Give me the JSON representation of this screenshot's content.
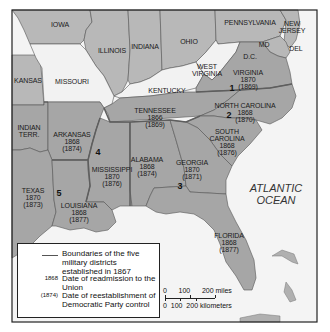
{
  "map": {
    "subject": "Reconstruction in the South — military districts and readmission dates",
    "colors": {
      "confederate_states": "#a6a6a6",
      "union_states": "#b8b8b8",
      "border_states": "#f2f2f2",
      "ocean": "#f4f4f4",
      "district_boundary": "#6e6e6e",
      "frame": "#222222"
    },
    "states": [
      {
        "name": "IOWA"
      },
      {
        "name": "ILLINOIS"
      },
      {
        "name": "INDIANA"
      },
      {
        "name": "OHIO"
      },
      {
        "name": "PENNSYLVANIA"
      },
      {
        "name": "NEW JERSEY",
        "lines": [
          "NEW",
          "JERSEY"
        ]
      },
      {
        "name": "MD"
      },
      {
        "name": "DEL"
      },
      {
        "name": "D.C."
      },
      {
        "name": "KANSAS"
      },
      {
        "name": "MISSOURI"
      },
      {
        "name": "KENTUCKY"
      },
      {
        "name": "WEST VIRGINIA",
        "lines": [
          "WEST",
          "VIRGINIA"
        ]
      },
      {
        "name": "INDIAN TERR.",
        "lines": [
          "INDIAN",
          "TERR."
        ]
      },
      {
        "name": "VIRGINIA",
        "readmission": "1870",
        "democratic_control": "(1869)"
      },
      {
        "name": "TENNESSEE",
        "readmission": "1866",
        "democratic_control": "(1869)"
      },
      {
        "name": "NORTH CAROLINA",
        "readmission": "1868",
        "democratic_control": "(1870)"
      },
      {
        "name": "SOUTH CAROLINA",
        "lines": [
          "SOUTH",
          "CAROLINA"
        ],
        "readmission": "1868",
        "democratic_control": "(1876)"
      },
      {
        "name": "ARKANSAS",
        "readmission": "1868",
        "democratic_control": "(1874)"
      },
      {
        "name": "MISSISSIPPI",
        "readmission": "1870",
        "democratic_control": "(1876)"
      },
      {
        "name": "ALABAMA",
        "readmission": "1868",
        "democratic_control": "(1874)"
      },
      {
        "name": "GEORGIA",
        "readmission": "1870",
        "democratic_control": "(1871)"
      },
      {
        "name": "TEXAS",
        "readmission": "1870",
        "democratic_control": "(1873)"
      },
      {
        "name": "LOUISIANA",
        "readmission": "1868",
        "democratic_control": "(1877)"
      },
      {
        "name": "FLORIDA",
        "readmission": "1868",
        "democratic_control": "(1877)"
      }
    ],
    "district_numbers": [
      "1",
      "2",
      "3",
      "4",
      "5"
    ],
    "ocean_label": [
      "ATLANTIC",
      "OCEAN"
    ]
  },
  "legend": {
    "rows": [
      {
        "key": "line",
        "text": "Boundaries of the five military districts established in 1867"
      },
      {
        "key": "1868",
        "text": "Date of readmission to the Union"
      },
      {
        "key": "(1874)",
        "text": "Date of reestablishment of Democratic Party control"
      }
    ]
  },
  "scale": {
    "miles": "0      100      200 miles",
    "kilometers": "0  100  200 kilometers"
  }
}
